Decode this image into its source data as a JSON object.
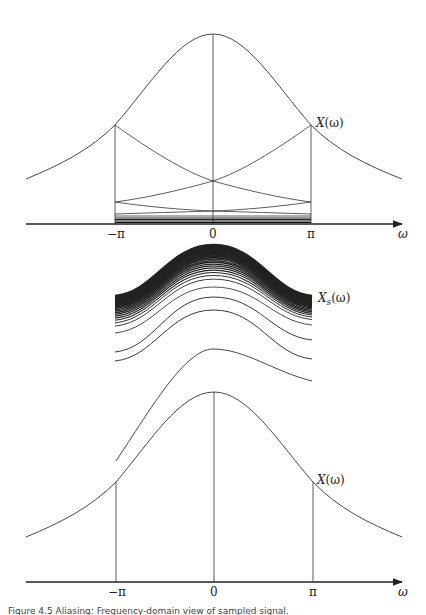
{
  "chart_data": [
    {
      "type": "line",
      "panel": "top",
      "title": "",
      "xlabel": "ω",
      "ylabel": "",
      "x_ticks": [
        "−π",
        "0",
        "π"
      ],
      "curve_label": "X(ω)",
      "description": "Bell-shaped spectrum X(ω) over wide ω range, with vertical lines at −π, 0, π; shifted copies of X(ω) restricted to [−π, π] shown as decaying curves stacked near the axis.",
      "grid": false
    },
    {
      "type": "line",
      "panel": "middle",
      "title": "",
      "curve_label": "X_s(ω)",
      "description": "Family of periodic-sum partial curves over [−π, π] converging upward (dense top band) to X_s(ω).",
      "grid": false
    },
    {
      "type": "line",
      "panel": "bottom",
      "title": "",
      "xlabel": "ω",
      "x_ticks": [
        "−π",
        "0",
        "π"
      ],
      "curve_label": "X(ω)",
      "description": "Original bell-shaped spectrum X(ω) with vertical lines at −π, 0, π.",
      "grid": false
    }
  ],
  "top": {
    "axis_label": "ω",
    "ticks": [
      "−π",
      "0",
      "π"
    ],
    "curve_label_main": "X",
    "curve_label_arg": "(ω)"
  },
  "middle": {
    "curve_label_main": "X",
    "curve_label_sub": "s",
    "curve_label_arg": "(ω)"
  },
  "bottom": {
    "axis_label": "ω",
    "ticks": [
      "−π",
      "0",
      "π"
    ],
    "curve_label_main": "X",
    "curve_label_arg": "(ω)"
  },
  "caption": "Figure 4.5   Aliasing: Frequency-domain view of sampled signal."
}
